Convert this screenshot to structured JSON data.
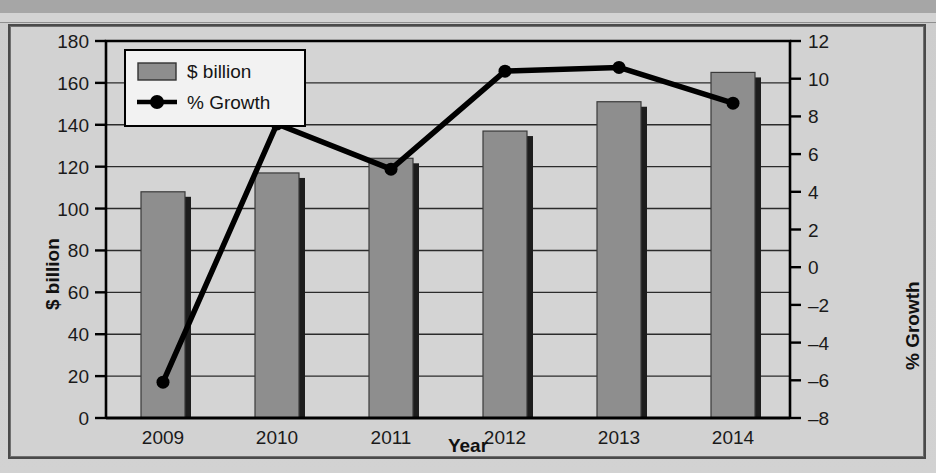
{
  "page": {
    "background_color": "#d2d2d2",
    "ghost_text_right": [
      "This is a",
      "and the",
      "Exhibit"
    ]
  },
  "chart_data": {
    "type": "bar",
    "title": "",
    "xlabel": "Year",
    "ylabel": "$ billion",
    "y2label": "% Growth",
    "categories": [
      "2009",
      "2010",
      "2011",
      "2012",
      "2013",
      "2014"
    ],
    "ylim": [
      0,
      180
    ],
    "yticks": [
      0,
      20,
      40,
      60,
      80,
      100,
      120,
      140,
      160,
      180
    ],
    "y2lim": [
      -8,
      12
    ],
    "y2ticks": [
      -8,
      -6,
      -4,
      -2,
      0,
      2,
      4,
      6,
      8,
      10,
      12
    ],
    "grid": true,
    "legend_position": "top-left",
    "series": [
      {
        "name": "$ billion",
        "kind": "bar",
        "axis": "left",
        "color": "#8e8e8e",
        "values": [
          108,
          117,
          124,
          137,
          151,
          165
        ]
      },
      {
        "name": "% Growth",
        "kind": "line",
        "axis": "right",
        "color": "#000000",
        "values": [
          -6.1,
          7.6,
          5.2,
          10.4,
          10.6,
          8.7
        ]
      }
    ]
  },
  "legend": {
    "items": [
      {
        "label": "$ billion",
        "marker": "bar-swatch"
      },
      {
        "label": "% Growth",
        "marker": "line-dot-marker"
      }
    ]
  }
}
